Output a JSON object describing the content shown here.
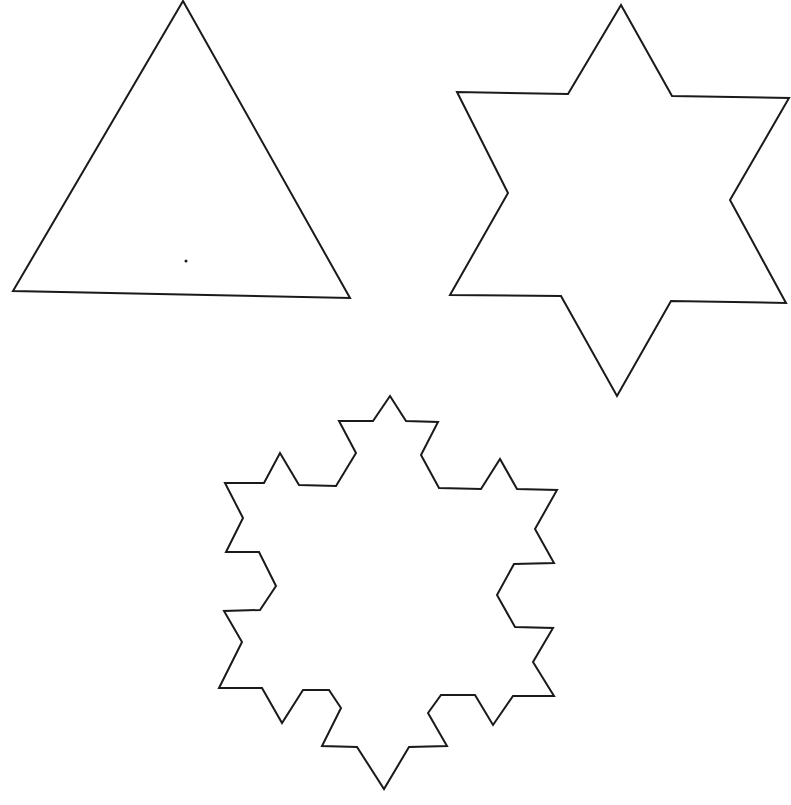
{
  "diagram": {
    "stroke_color": "#1a1a1a",
    "background": "#ffffff",
    "shapes": [
      {
        "name": "koch-iteration-0-triangle",
        "points": "183,1 350,298 13,291"
      },
      {
        "name": "koch-iteration-1-star",
        "points": "621,5 672,96 789,98 730,200 786,303 671,301 617,396 561,296 450,295 508,193 457,92 568,94"
      },
      {
        "name": "koch-iteration-2-snowflake",
        "points": "390,396 406,421 438,422 421,455 439,488 481,489 500,459 517,489 557,490 535,529 554,563 514,564 497,595 515,627 553,628 533,662 554,696 513,696 493,725 475,695 441,695 428,713 447,746 409,747 384,789 357,747 322,746 341,708 329,690 303,690 282,723 262,688 219,688 242,642 224,611 260,610 276,586 259,552 226,552 243,518 225,483 264,483 280,453 299,485 336,486 356,453 339,421 373,421"
      }
    ],
    "marks": [
      {
        "name": "center-dot",
        "cx": 186,
        "cy": 261,
        "r": 1.5
      }
    ]
  }
}
